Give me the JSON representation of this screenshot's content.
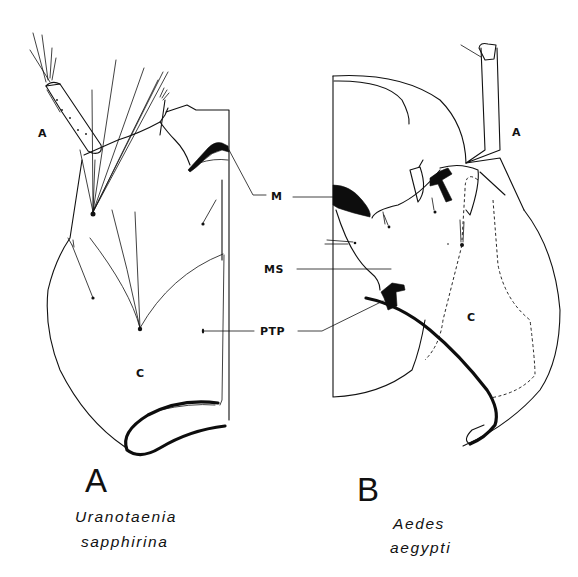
{
  "figure": {
    "panels": [
      {
        "id": "A",
        "panel_letter": "A",
        "species_line1": "Uranotaenia",
        "species_line2": "sapphirina",
        "part_labels": {
          "antenna": "A",
          "clypeus": "C"
        }
      },
      {
        "id": "B",
        "panel_letter": "B",
        "species_line1": "Aedes",
        "species_line2": "aegypti",
        "part_labels": {
          "antenna": "A",
          "clypeus": "C"
        }
      }
    ],
    "shared_labels": {
      "m": "M",
      "ms": "MS",
      "ptp": "PTP"
    },
    "colors": {
      "ink": "#111111",
      "background": "#ffffff"
    }
  }
}
